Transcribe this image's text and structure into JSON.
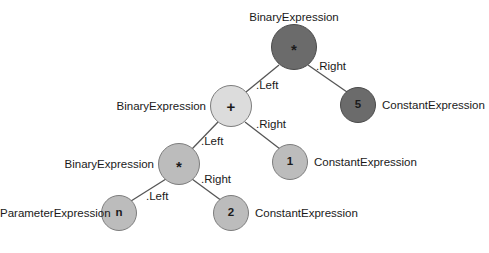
{
  "diagram": {
    "background_color": "#ffffff",
    "colors": {
      "node_dark": "#6b6b6b",
      "node_mid": "#bcbcbc",
      "node_light": "#dcdcdc",
      "edge_stroke": "#555555",
      "text": "#1a1a1a"
    },
    "nodes": [
      {
        "id": "root-multiply",
        "symbol": "*",
        "type_label": "BinaryExpression",
        "shade": "dark",
        "cx": 294,
        "cy": 47,
        "r": 23,
        "label_x": 294,
        "label_y": 11,
        "label_anchor": "center"
      },
      {
        "id": "constant-5",
        "symbol": "5",
        "type_label": "ConstantExpression",
        "shade": "dark",
        "cx": 358,
        "cy": 105,
        "r": 18,
        "label_x": 382,
        "label_y": 99,
        "label_anchor": "left"
      },
      {
        "id": "plus",
        "symbol": "+",
        "type_label": "BinaryExpression",
        "shade": "light",
        "cx": 231,
        "cy": 106,
        "r": 21,
        "label_x": 206,
        "label_y": 100,
        "label_anchor": "right"
      },
      {
        "id": "constant-1",
        "symbol": "1",
        "type_label": "ConstantExpression",
        "shade": "mid",
        "cx": 290,
        "cy": 162,
        "r": 18,
        "label_x": 314,
        "label_y": 156,
        "label_anchor": "left"
      },
      {
        "id": "inner-multiply",
        "symbol": "*",
        "type_label": "BinaryExpression",
        "shade": "mid",
        "cx": 179,
        "cy": 164,
        "r": 21,
        "label_x": 154,
        "label_y": 158,
        "label_anchor": "right"
      },
      {
        "id": "parameter-n",
        "symbol": "n",
        "type_label": "ParameterExpression",
        "shade": "mid",
        "cx": 119,
        "cy": 213,
        "r": 18,
        "label_x": 95,
        "label_y": 207,
        "label_anchor": "right"
      },
      {
        "id": "constant-2",
        "symbol": "2",
        "type_label": "ConstantExpression",
        "shade": "mid",
        "cx": 231,
        "cy": 213,
        "r": 18,
        "label_x": 255,
        "label_y": 207,
        "label_anchor": "left"
      }
    ],
    "edges": [
      {
        "id": "root-left",
        "from": "root-multiply",
        "to": "plus",
        "label": ".Left",
        "x1": 279,
        "y1": 65,
        "x2": 246,
        "y2": 92,
        "label_x": 256,
        "label_y": 79
      },
      {
        "id": "root-right",
        "from": "root-multiply",
        "to": "constant-5",
        "label": ".Right",
        "x1": 308,
        "y1": 65,
        "x2": 347,
        "y2": 92,
        "label_x": 316,
        "label_y": 60
      },
      {
        "id": "plus-left",
        "from": "plus",
        "to": "inner-multiply",
        "label": ".Left",
        "x1": 218,
        "y1": 122,
        "x2": 192,
        "y2": 149,
        "label_x": 201,
        "label_y": 135
      },
      {
        "id": "plus-right",
        "from": "plus",
        "to": "constant-1",
        "label": ".Right",
        "x1": 245,
        "y1": 122,
        "x2": 280,
        "y2": 149,
        "label_x": 256,
        "label_y": 118
      },
      {
        "id": "inner-left",
        "from": "inner-multiply",
        "to": "parameter-n",
        "label": ".Left",
        "x1": 166,
        "y1": 179,
        "x2": 131,
        "y2": 201,
        "label_x": 146,
        "label_y": 190
      },
      {
        "id": "inner-right",
        "from": "inner-multiply",
        "to": "constant-2",
        "label": ".Right",
        "x1": 192,
        "y1": 179,
        "x2": 222,
        "y2": 201,
        "label_x": 201,
        "label_y": 173
      }
    ],
    "caption": ""
  }
}
